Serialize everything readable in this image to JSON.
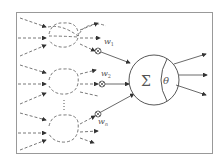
{
  "diagram": {
    "frame_color": "#999999",
    "line_color": "#444444",
    "dashed_color": "#555555",
    "weights": [
      {
        "label": "w",
        "subscript": "1"
      },
      {
        "label": "w",
        "subscript": "2"
      },
      {
        "label": "w",
        "subscript": "n"
      }
    ],
    "neuron": {
      "sum_symbol": "Σ",
      "threshold_symbol": "θ"
    },
    "multiply_symbol": "⊗",
    "ellipsis": "⋮"
  }
}
